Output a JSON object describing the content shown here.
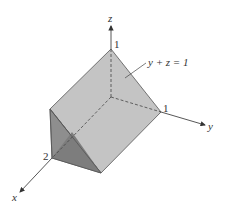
{
  "diagram": {
    "type": "3d-solid",
    "axes": {
      "x": {
        "label": "x",
        "tick_label": "2"
      },
      "y": {
        "label": "y",
        "tick_label": "1"
      },
      "z": {
        "label": "z",
        "tick_label": "1"
      }
    },
    "plane_label": "y + z = 1",
    "colors": {
      "top_face": "#c4c4c4",
      "front_face": "#8e8e8e",
      "bottom_face": "#a9a9a9",
      "edge": "#555555",
      "axis": "#444444"
    }
  }
}
